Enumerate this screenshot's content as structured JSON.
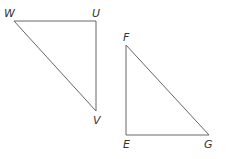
{
  "diagram": {
    "type": "two right triangles",
    "triangles": [
      {
        "name": "WUV",
        "vertices": [
          {
            "label": "W",
            "x": 14,
            "y": 21,
            "label_x": 4,
            "label_y": 17
          },
          {
            "label": "U",
            "x": 96,
            "y": 21,
            "label_x": 92,
            "label_y": 17
          },
          {
            "label": "V",
            "x": 96,
            "y": 111,
            "label_x": 93,
            "label_y": 124
          }
        ],
        "right_angle_at": "U"
      },
      {
        "name": "FEG",
        "vertices": [
          {
            "label": "F",
            "x": 126,
            "y": 45,
            "label_x": 123,
            "label_y": 41
          },
          {
            "label": "E",
            "x": 126,
            "y": 135,
            "label_x": 123,
            "label_y": 148
          },
          {
            "label": "G",
            "x": 209,
            "y": 135,
            "label_x": 204,
            "label_y": 148
          }
        ],
        "right_angle_at": "E"
      }
    ],
    "labels": {
      "W": "W",
      "U": "U",
      "V": "V",
      "F": "F",
      "E": "E",
      "G": "G"
    },
    "line_color": "#666666"
  }
}
